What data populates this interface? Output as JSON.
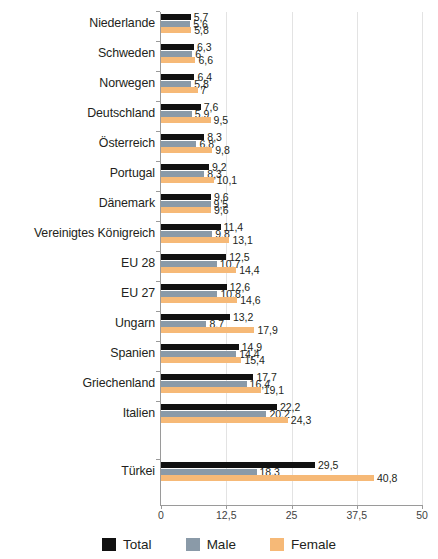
{
  "chart_data": {
    "type": "bar",
    "orientation": "horizontal",
    "title": "",
    "subtitle": "",
    "xlabel": "",
    "ylabel": "",
    "xlim": [
      0,
      50
    ],
    "xticks": [
      "0",
      "12,5",
      "25",
      "37,5",
      "50"
    ],
    "xtick_values": [
      0,
      12.5,
      25,
      37.5,
      50
    ],
    "grid": true,
    "grid_axis": "x",
    "legend_position": "bottom",
    "decimal_separator": ",",
    "categories": [
      "Niederlande",
      "Schweden",
      "Norwegen",
      "Deutschland",
      "Österreich",
      "Portugal",
      "Dänemark",
      "Vereinigtes Königreich",
      "EU 28",
      "EU 27",
      "Ungarn",
      "Spanien",
      "Griechenland",
      "Italien",
      "Türkei"
    ],
    "series": [
      {
        "name": "Total",
        "color": "#111111",
        "values": [
          5.7,
          6.3,
          6.4,
          7.6,
          8.3,
          9.2,
          9.6,
          11.4,
          12.5,
          12.6,
          13.2,
          14.9,
          17.7,
          22.2,
          29.5
        ],
        "labels": [
          "5,7",
          "6,3",
          "6,4",
          "7,6",
          "8,3",
          "9,2",
          "9,6",
          "11,4",
          "12,5",
          "12,6",
          "13,2",
          "14,9",
          "17,7",
          "22,2",
          "29,5"
        ]
      },
      {
        "name": "Male",
        "color": "#8a9aa8",
        "values": [
          5.6,
          6,
          5.8,
          5.9,
          6.8,
          8.3,
          9.5,
          9.8,
          10.7,
          10.8,
          8.7,
          14.4,
          16.4,
          20.2,
          18.3
        ],
        "labels": [
          "5,6",
          "6",
          "5,8",
          "5,9",
          "6,8",
          "8,3",
          "9,5",
          "9,8",
          "10,7",
          "10,8",
          "8,7",
          "14,4",
          "16,4",
          "20,2",
          "18,3"
        ]
      },
      {
        "name": "Female",
        "color": "#f6b977",
        "values": [
          5.8,
          6.6,
          7,
          9.5,
          9.8,
          10.1,
          9.6,
          13.1,
          14.4,
          14.6,
          17.9,
          15.4,
          19.1,
          24.3,
          40.8
        ],
        "labels": [
          "5,8",
          "6,6",
          "7",
          "9,5",
          "9,8",
          "10,1",
          "9,6",
          "13,1",
          "14,4",
          "14,6",
          "17,9",
          "15,4",
          "19,1",
          "24,3",
          "40,8"
        ]
      }
    ],
    "group_gap_after_index": 13
  },
  "legend": {
    "items": [
      {
        "label": "Total",
        "swatch": "total"
      },
      {
        "label": "Male",
        "swatch": "male"
      },
      {
        "label": "Female",
        "swatch": "female"
      }
    ]
  },
  "colors": {
    "total": "#111111",
    "male": "#8a9aa8",
    "female": "#f6b977",
    "axis": "#9a9a9a",
    "grid": "#e3e3e3",
    "text": "#231f20",
    "background": "#ffffff"
  }
}
